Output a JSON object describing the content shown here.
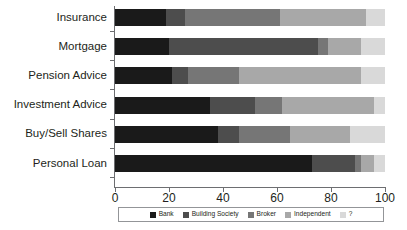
{
  "chart_data": {
    "type": "bar",
    "subtype": "stacked-horizontal-100",
    "title": "",
    "xlabel": "",
    "ylabel": "",
    "xlim": [
      0,
      100
    ],
    "xticks": [
      0,
      20,
      40,
      60,
      80,
      100
    ],
    "grid": false,
    "legend_position": "bottom",
    "categories": [
      "Insurance",
      "Mortgage",
      "Pension Advice",
      "Investment Advice",
      "Buy/Sell Shares",
      "Personal Loan"
    ],
    "series": [
      {
        "name": "Bank",
        "color": "#1a1a1a",
        "values": [
          19,
          20,
          21,
          35,
          38,
          73
        ]
      },
      {
        "name": "Building Society",
        "color": "#4d4d4d",
        "values": [
          7,
          55,
          6,
          17,
          8,
          16
        ]
      },
      {
        "name": "Broker",
        "color": "#767676",
        "values": [
          35,
          4,
          19,
          10,
          19,
          2
        ]
      },
      {
        "name": "Independent",
        "color": "#a8a8a8",
        "values": [
          32,
          12,
          45,
          34,
          22,
          5
        ]
      },
      {
        "name": "?",
        "color": "#d9d9d9",
        "values": [
          7,
          9,
          9,
          4,
          13,
          4
        ]
      }
    ]
  },
  "axis": {
    "tick_labels": [
      "0",
      "20",
      "40",
      "60",
      "80",
      "100"
    ]
  },
  "legend": {
    "items": [
      {
        "label": "Bank",
        "color": "#1a1a1a"
      },
      {
        "label": "Building Society",
        "color": "#4d4d4d"
      },
      {
        "label": "Broker",
        "color": "#767676"
      },
      {
        "label": "Independent",
        "color": "#a8a8a8"
      },
      {
        "label": "?",
        "color": "#d9d9d9"
      }
    ]
  }
}
